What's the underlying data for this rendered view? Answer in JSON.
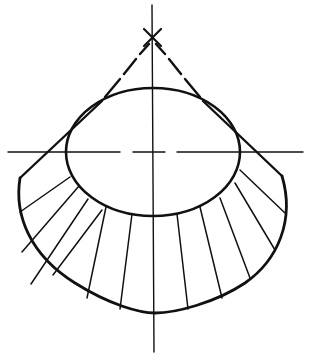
{
  "diagram": {
    "type": "technical-drawing",
    "colors": {
      "stroke": "#111111",
      "background": "#ffffff"
    },
    "apex_marker": "x-mark",
    "centerlines": [
      "vertical-axis",
      "horizontal-axis"
    ],
    "hatch_line_count": 10
  }
}
